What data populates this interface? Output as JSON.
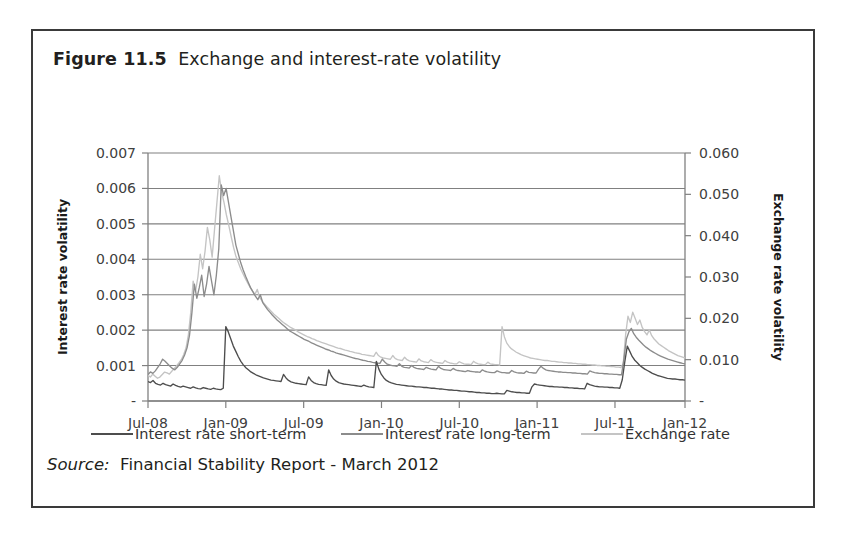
{
  "figure": {
    "label": "Figure 11.5",
    "caption": "Exchange and interest-rate volatility",
    "source_keyword": "Source:",
    "source_text": "Financial Stability Report - March 2012"
  },
  "colors": {
    "short_term": "#4d4d4d",
    "long_term": "#8c8c8c",
    "exchange_rate": "#c4c4c4",
    "axis": "#808080",
    "grid": "#808080",
    "text": "#231f20",
    "frame": "#3a3a3a"
  },
  "chart_data": {
    "type": "line",
    "title": "Exchange and interest-rate volatility",
    "xlabel": "",
    "ylabel": "Interest rate volatility",
    "y2label": "Exchange rate volatility",
    "grid": true,
    "legend_position": "bottom",
    "ylim": [
      0,
      0.007
    ],
    "y2lim": [
      0,
      0.06
    ],
    "yticks": [
      "-",
      "0.001",
      "0.002",
      "0.003",
      "0.004",
      "0.005",
      "0.006",
      "0.007"
    ],
    "ytick_values": [
      0,
      0.001,
      0.002,
      0.003,
      0.004,
      0.005,
      0.006,
      0.007
    ],
    "y2ticks": [
      "-",
      "0.010",
      "0.020",
      "0.030",
      "0.040",
      "0.050",
      "0.060"
    ],
    "y2tick_values": [
      0,
      0.01,
      0.02,
      0.03,
      0.04,
      0.05,
      0.06
    ],
    "xticks": [
      "Jul-08",
      "Jan-09",
      "Jul-09",
      "Jan-10",
      "Jul-10",
      "Jan-11",
      "Jul-11",
      "Jan-12"
    ],
    "xtick_positions": [
      0,
      0.1449,
      0.2899,
      0.4348,
      0.5797,
      0.7246,
      0.8696,
      1.0
    ],
    "series": [
      {
        "name": "Interest rate short-term",
        "axis": "left",
        "color": "#4d4d4d",
        "values": [
          0.00055,
          0.00052,
          0.00058,
          0.0005,
          0.00047,
          0.00045,
          0.0005,
          0.00046,
          0.00044,
          0.00042,
          0.00048,
          0.00044,
          0.00041,
          0.00039,
          0.00042,
          0.0004,
          0.00038,
          0.00036,
          0.0004,
          0.00037,
          0.00035,
          0.00034,
          0.00038,
          0.00036,
          0.00034,
          0.00033,
          0.00036,
          0.00034,
          0.00033,
          0.00032,
          0.00036,
          0.0021,
          0.00195,
          0.00175,
          0.00155,
          0.0014,
          0.00125,
          0.00112,
          0.00102,
          0.00094,
          0.00088,
          0.00082,
          0.00078,
          0.00074,
          0.00071,
          0.00068,
          0.00065,
          0.00063,
          0.00061,
          0.00059,
          0.00058,
          0.00057,
          0.00056,
          0.00055,
          0.00075,
          0.00065,
          0.00058,
          0.00054,
          0.00052,
          0.0005,
          0.00049,
          0.00048,
          0.00047,
          0.00046,
          0.00068,
          0.00058,
          0.00052,
          0.00049,
          0.00047,
          0.00046,
          0.00045,
          0.00044,
          0.00088,
          0.00072,
          0.00062,
          0.00056,
          0.00052,
          0.0005,
          0.00048,
          0.00047,
          0.00046,
          0.00045,
          0.00044,
          0.00043,
          0.00042,
          0.00041,
          0.00045,
          0.00042,
          0.0004,
          0.00039,
          0.00038,
          0.00112,
          0.0009,
          0.00075,
          0.00065,
          0.00058,
          0.00054,
          0.00051,
          0.00049,
          0.00047,
          0.00046,
          0.00045,
          0.00044,
          0.00043,
          0.00042,
          0.00042,
          0.00041,
          0.0004,
          0.0004,
          0.00039,
          0.00038,
          0.00038,
          0.00037,
          0.00036,
          0.00036,
          0.00035,
          0.00034,
          0.00034,
          0.00033,
          0.00032,
          0.00031,
          0.00031,
          0.0003,
          0.0003,
          0.00029,
          0.00028,
          0.00028,
          0.00027,
          0.00026,
          0.00026,
          0.00025,
          0.00024,
          0.00024,
          0.00023,
          0.00023,
          0.00022,
          0.00022,
          0.00021,
          0.00021,
          0.00022,
          0.00021,
          0.0002,
          0.0002,
          0.0003,
          0.00028,
          0.00026,
          0.00025,
          0.00024,
          0.00024,
          0.00023,
          0.00023,
          0.00022,
          0.00022,
          0.0004,
          0.00048,
          0.00046,
          0.00045,
          0.00044,
          0.00043,
          0.00042,
          0.00041,
          0.00041,
          0.0004,
          0.0004,
          0.00039,
          0.00039,
          0.00038,
          0.00038,
          0.00037,
          0.00037,
          0.00036,
          0.00036,
          0.00035,
          0.00035,
          0.00034,
          0.0005,
          0.00046,
          0.00044,
          0.00042,
          0.00041,
          0.0004,
          0.0004,
          0.00039,
          0.00039,
          0.00038,
          0.00038,
          0.00037,
          0.00037,
          0.00036,
          0.0006,
          0.0011,
          0.00155,
          0.0014,
          0.00125,
          0.00115,
          0.00108,
          0.001,
          0.00095,
          0.0009,
          0.00086,
          0.00082,
          0.00078,
          0.00075,
          0.00072,
          0.0007,
          0.00068,
          0.00066,
          0.00064,
          0.00063,
          0.00062,
          0.00062,
          0.00061,
          0.0006,
          0.0006,
          0.00059
        ]
      },
      {
        "name": "Interest rate long-term",
        "axis": "left",
        "color": "#8c8c8c",
        "values": [
          0.00075,
          0.00082,
          0.00078,
          0.00085,
          0.00095,
          0.00105,
          0.00118,
          0.00112,
          0.00105,
          0.00098,
          0.00092,
          0.00088,
          0.00095,
          0.00105,
          0.00115,
          0.0013,
          0.0015,
          0.00185,
          0.0025,
          0.0033,
          0.0029,
          0.0032,
          0.00355,
          0.00295,
          0.0033,
          0.0038,
          0.0034,
          0.003,
          0.00355,
          0.0043,
          0.0061,
          0.0058,
          0.006,
          0.0056,
          0.0052,
          0.0048,
          0.0044,
          0.00415,
          0.0039,
          0.0037,
          0.00352,
          0.00336,
          0.0032,
          0.00308,
          0.00296,
          0.00286,
          0.003,
          0.00278,
          0.00268,
          0.00258,
          0.0025,
          0.00242,
          0.00235,
          0.00228,
          0.00222,
          0.00216,
          0.0021,
          0.00204,
          0.00198,
          0.00194,
          0.0019,
          0.00186,
          0.00182,
          0.00178,
          0.00174,
          0.00171,
          0.00168,
          0.00164,
          0.00161,
          0.00158,
          0.00155,
          0.00152,
          0.00149,
          0.00146,
          0.00144,
          0.00141,
          0.00139,
          0.00136,
          0.00134,
          0.00132,
          0.0013,
          0.00128,
          0.00126,
          0.00124,
          0.00122,
          0.0012,
          0.00119,
          0.00117,
          0.00115,
          0.00114,
          0.00112,
          0.00111,
          0.00109,
          0.00108,
          0.00107,
          0.00106,
          0.00118,
          0.0011,
          0.00104,
          0.00102,
          0.001,
          0.00099,
          0.00098,
          0.00105,
          0.00098,
          0.00095,
          0.00094,
          0.00093,
          0.001,
          0.00095,
          0.00092,
          0.00091,
          0.0009,
          0.00089,
          0.00095,
          0.00092,
          0.0009,
          0.00089,
          0.00088,
          0.00098,
          0.00092,
          0.00089,
          0.00088,
          0.00087,
          0.00086,
          0.00092,
          0.00088,
          0.00086,
          0.00085,
          0.00084,
          0.00083,
          0.00086,
          0.00084,
          0.00083,
          0.00082,
          0.00082,
          0.00081,
          0.00088,
          0.00084,
          0.00082,
          0.00081,
          0.0008,
          0.0008,
          0.00085,
          0.00082,
          0.0008,
          0.0008,
          0.00079,
          0.00079,
          0.00086,
          0.00082,
          0.0008,
          0.00079,
          0.00079,
          0.00078,
          0.00084,
          0.00081,
          0.0008,
          0.00079,
          0.00079,
          0.0009,
          0.00098,
          0.00092,
          0.00088,
          0.00086,
          0.00085,
          0.00084,
          0.00083,
          0.00082,
          0.00082,
          0.00081,
          0.00081,
          0.0008,
          0.0008,
          0.00079,
          0.00079,
          0.00078,
          0.00078,
          0.00077,
          0.00077,
          0.00076,
          0.00085,
          0.00082,
          0.0008,
          0.00079,
          0.00078,
          0.00078,
          0.00077,
          0.00077,
          0.00076,
          0.00076,
          0.00075,
          0.00075,
          0.00074,
          0.00074,
          0.0012,
          0.00175,
          0.00195,
          0.00205,
          0.0019,
          0.0018,
          0.00172,
          0.00165,
          0.00158,
          0.00152,
          0.00147,
          0.00142,
          0.00138,
          0.00134,
          0.0013,
          0.00127,
          0.00124,
          0.00121,
          0.00118,
          0.00116,
          0.00114,
          0.00112,
          0.0011,
          0.00108,
          0.00106,
          0.00105
        ]
      },
      {
        "name": "Exchange rate",
        "axis": "right",
        "color": "#c4c4c4",
        "values": [
          0.0062,
          0.0058,
          0.0065,
          0.006,
          0.0055,
          0.0058,
          0.0064,
          0.007,
          0.0068,
          0.0065,
          0.0072,
          0.0078,
          0.0085,
          0.0092,
          0.01,
          0.0112,
          0.0128,
          0.016,
          0.0215,
          0.029,
          0.0265,
          0.03,
          0.0355,
          0.032,
          0.0362,
          0.042,
          0.039,
          0.0348,
          0.0415,
          0.048,
          0.0545,
          0.0505,
          0.048,
          0.045,
          0.0425,
          0.0398,
          0.0372,
          0.035,
          0.0335,
          0.032,
          0.0308,
          0.0296,
          0.0285,
          0.0275,
          0.0266,
          0.0258,
          0.027,
          0.025,
          0.0242,
          0.0235,
          0.0228,
          0.0222,
          0.0216,
          0.021,
          0.0205,
          0.02,
          0.0195,
          0.019,
          0.0186,
          0.0182,
          0.0178,
          0.0175,
          0.0172,
          0.0168,
          0.0165,
          0.0162,
          0.0159,
          0.0156,
          0.0154,
          0.0151,
          0.0149,
          0.0146,
          0.0144,
          0.0142,
          0.014,
          0.0138,
          0.0136,
          0.0134,
          0.0132,
          0.013,
          0.0128,
          0.0127,
          0.0125,
          0.0123,
          0.0122,
          0.012,
          0.0119,
          0.0117,
          0.0116,
          0.0115,
          0.0113,
          0.0112,
          0.0111,
          0.011,
          0.0109,
          0.0108,
          0.0118,
          0.011,
          0.0106,
          0.0104,
          0.0103,
          0.0102,
          0.0101,
          0.011,
          0.0103,
          0.01,
          0.0099,
          0.0098,
          0.0106,
          0.01,
          0.0097,
          0.0096,
          0.0095,
          0.0094,
          0.0102,
          0.0097,
          0.0095,
          0.0094,
          0.0093,
          0.01,
          0.0096,
          0.0094,
          0.0093,
          0.0092,
          0.0091,
          0.0098,
          0.0094,
          0.0092,
          0.0091,
          0.009,
          0.009,
          0.0095,
          0.0092,
          0.009,
          0.0089,
          0.0089,
          0.0088,
          0.0096,
          0.0092,
          0.009,
          0.0089,
          0.0088,
          0.0088,
          0.0094,
          0.009,
          0.0089,
          0.0088,
          0.0088,
          0.0087,
          0.018,
          0.0155,
          0.014,
          0.0132,
          0.0126,
          0.0122,
          0.0118,
          0.0115,
          0.0112,
          0.011,
          0.0108,
          0.0106,
          0.0104,
          0.0103,
          0.0102,
          0.0101,
          0.01,
          0.0099,
          0.0098,
          0.0098,
          0.0097,
          0.0096,
          0.0096,
          0.0095,
          0.0094,
          0.0094,
          0.0093,
          0.0093,
          0.0092,
          0.0092,
          0.0091,
          0.0091,
          0.009,
          0.009,
          0.0089,
          0.0089,
          0.0088,
          0.0088,
          0.0087,
          0.0087,
          0.0086,
          0.0086,
          0.0085,
          0.0085,
          0.0084,
          0.0084,
          0.0083,
          0.0083,
          0.0082,
          0.0082,
          0.0081,
          0.009,
          0.016,
          0.0205,
          0.019,
          0.0215,
          0.02,
          0.0185,
          0.0196,
          0.0178,
          0.0168,
          0.016,
          0.0172,
          0.0158,
          0.015,
          0.0144,
          0.0138,
          0.0134,
          0.013,
          0.0126,
          0.0122,
          0.0119,
          0.0116,
          0.0113,
          0.011,
          0.0108,
          0.0106,
          0.0104
        ]
      }
    ]
  },
  "legend": [
    {
      "label": "Interest rate short-term",
      "color": "#4d4d4d"
    },
    {
      "label": "Interest rate long-term",
      "color": "#8c8c8c"
    },
    {
      "label": "Exchange rate",
      "color": "#c4c4c4"
    }
  ]
}
